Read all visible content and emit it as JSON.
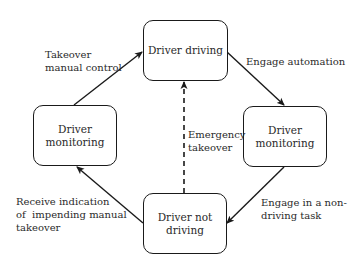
{
  "diagram": {
    "type": "state-cycle",
    "nodes": [
      {
        "id": "driver-driving",
        "lines": [
          "Driver driving"
        ]
      },
      {
        "id": "driver-monitoring-right",
        "lines": [
          "Driver",
          "monitoring"
        ]
      },
      {
        "id": "driver-not-driving",
        "lines": [
          "Driver not",
          "driving"
        ]
      },
      {
        "id": "driver-monitoring-left",
        "lines": [
          "Driver",
          "monitoring"
        ]
      }
    ],
    "edges": [
      {
        "from": "driver-driving",
        "to": "driver-monitoring-right",
        "style": "solid",
        "label_lines": [
          "Engage automation"
        ]
      },
      {
        "from": "driver-monitoring-right",
        "to": "driver-not-driving",
        "style": "solid",
        "label_lines": [
          "Engage in a non-",
          "driving task"
        ]
      },
      {
        "from": "driver-not-driving",
        "to": "driver-monitoring-left",
        "style": "solid",
        "label_lines": [
          "Receive indication",
          "of  impending manual",
          "takeover"
        ]
      },
      {
        "from": "driver-monitoring-left",
        "to": "driver-driving",
        "style": "solid",
        "label_lines": [
          "Takeover",
          "manual control"
        ]
      },
      {
        "from": "driver-not-driving",
        "to": "driver-driving",
        "style": "dashed",
        "label_lines": [
          "Emergency",
          "takeover"
        ]
      }
    ]
  },
  "colors": {
    "stroke": "#1a1a1a",
    "text": "#2a2a2a",
    "background": "#ffffff"
  }
}
